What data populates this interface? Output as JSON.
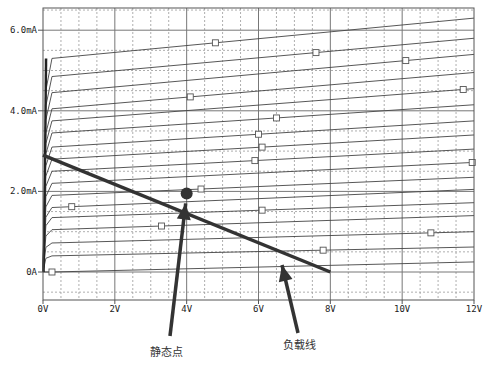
{
  "chart_data": {
    "type": "line",
    "title": "",
    "xlabel": "",
    "ylabel": "",
    "xlim": [
      0,
      12
    ],
    "ylim": [
      -0.7,
      6.5
    ],
    "grid": true,
    "x_ticks": [
      {
        "value": 0,
        "label": "0V"
      },
      {
        "value": 2,
        "label": "2V"
      },
      {
        "value": 4,
        "label": "4V"
      },
      {
        "value": 6,
        "label": "6V"
      },
      {
        "value": 8,
        "label": "8V"
      },
      {
        "value": 10,
        "label": "10V"
      },
      {
        "value": 12,
        "label": "12V"
      }
    ],
    "y_ticks": [
      {
        "value": 0,
        "label": "0A"
      },
      {
        "value": 2,
        "label": "2.0mA"
      },
      {
        "value": 4,
        "label": "4.0mA"
      },
      {
        "value": 6,
        "label": "6.0mA"
      }
    ],
    "series": [
      {
        "name": "curve-1",
        "sat_mA": 0.0,
        "end_mA": 0.25,
        "marker_x": 0.25
      },
      {
        "name": "curve-2",
        "sat_mA": 0.4,
        "end_mA": 0.62,
        "marker_x": 7.8
      },
      {
        "name": "curve-3",
        "sat_mA": 0.72,
        "end_mA": 1.0,
        "marker_x": 10.8
      },
      {
        "name": "curve-4",
        "sat_mA": 1.05,
        "end_mA": 1.4,
        "marker_x": 3.3
      },
      {
        "name": "curve-5",
        "sat_mA": 1.35,
        "end_mA": 1.72,
        "marker_x": 6.1
      },
      {
        "name": "curve-6",
        "sat_mA": 1.6,
        "end_mA": 2.05,
        "marker_x": 0.8
      },
      {
        "name": "curve-7",
        "sat_mA": 1.9,
        "end_mA": 2.35,
        "marker_x": 4.4
      },
      {
        "name": "curve-8",
        "sat_mA": 2.2,
        "end_mA": 2.72,
        "marker_x": 11.95
      },
      {
        "name": "curve-9",
        "sat_mA": 2.5,
        "end_mA": 3.05,
        "marker_x": 5.9
      },
      {
        "name": "curve-10",
        "sat_mA": 2.8,
        "end_mA": 3.4,
        "marker_x": 6.1
      },
      {
        "name": "curve-11",
        "sat_mA": 3.1,
        "end_mA": 3.75,
        "marker_x": 6.0
      },
      {
        "name": "curve-12",
        "sat_mA": 3.45,
        "end_mA": 4.15,
        "marker_x": 6.5
      },
      {
        "name": "curve-13",
        "sat_mA": 3.75,
        "end_mA": 4.55,
        "marker_x": 11.7
      },
      {
        "name": "curve-14",
        "sat_mA": 4.05,
        "end_mA": 4.95,
        "marker_x": 4.1
      },
      {
        "name": "curve-15",
        "sat_mA": 4.45,
        "end_mA": 5.4,
        "marker_x": 10.1
      },
      {
        "name": "curve-16",
        "sat_mA": 4.85,
        "end_mA": 5.8,
        "marker_x": 7.6
      },
      {
        "name": "curve-17",
        "sat_mA": 5.3,
        "end_mA": 6.3,
        "marker_x": 4.8
      }
    ],
    "load_line": {
      "x": [
        0,
        8
      ],
      "y": [
        2.9,
        0
      ]
    },
    "q_point": {
      "x": 4.0,
      "y": 1.95
    },
    "annotations": [
      {
        "text": "静态点",
        "points_to": "q_point"
      },
      {
        "text": "负载线",
        "points_to": "load_line"
      }
    ]
  }
}
